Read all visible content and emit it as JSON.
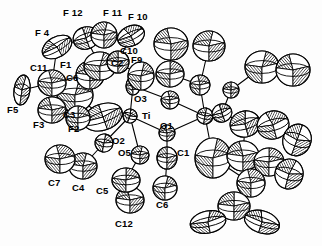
{
  "figure": {
    "kind": "ortep-thermal-ellipsoid-plot",
    "title": "",
    "caption": "",
    "background_color": "#fdfdfd",
    "line_color": "#000000",
    "fill_color": "#ffffff",
    "hatch_color": "#000000"
  },
  "chart_data": {
    "type": "scatter",
    "title": "",
    "xlabel": "",
    "ylabel": "",
    "grid": false,
    "legend": null,
    "labels": [
      {
        "text": "F 12",
        "x": 63,
        "y": 8
      },
      {
        "text": "F 11",
        "x": 103,
        "y": 8
      },
      {
        "text": "F 10",
        "x": 128,
        "y": 12
      },
      {
        "text": "F 4",
        "x": 35,
        "y": 28
      },
      {
        "text": "C10",
        "x": 120,
        "y": 46
      },
      {
        "text": "C11",
        "x": 30,
        "y": 63
      },
      {
        "text": "F1",
        "x": 60,
        "y": 60
      },
      {
        "text": "C2",
        "x": 111,
        "y": 58
      },
      {
        "text": "F9",
        "x": 131,
        "y": 55
      },
      {
        "text": "C6",
        "x": 66,
        "y": 73
      },
      {
        "text": "F5",
        "x": 7,
        "y": 105
      },
      {
        "text": "O3",
        "x": 134,
        "y": 94
      },
      {
        "text": "Ti",
        "x": 142,
        "y": 111
      },
      {
        "text": "C3",
        "x": 63,
        "y": 110
      },
      {
        "text": "F3",
        "x": 33,
        "y": 120
      },
      {
        "text": "F2",
        "x": 68,
        "y": 124
      },
      {
        "text": "O1",
        "x": 160,
        "y": 121
      },
      {
        "text": "O2",
        "x": 112,
        "y": 136
      },
      {
        "text": "O5",
        "x": 118,
        "y": 148
      },
      {
        "text": "C1",
        "x": 177,
        "y": 148
      },
      {
        "text": "C7",
        "x": 48,
        "y": 178
      },
      {
        "text": "C4",
        "x": 72,
        "y": 183
      },
      {
        "text": "C5",
        "x": 96,
        "y": 186
      },
      {
        "text": "C6",
        "x": 156,
        "y": 200
      },
      {
        "text": "C12",
        "x": 115,
        "y": 219
      }
    ],
    "atoms": [
      {
        "id": "Ti",
        "x": 130,
        "y": 116,
        "rx": 7,
        "ry": 7,
        "rot": 20,
        "style": "octant"
      },
      {
        "id": "Ti2",
        "x": 205,
        "y": 116,
        "rx": 8,
        "ry": 8,
        "rot": 10,
        "style": "octant"
      },
      {
        "id": "O3",
        "x": 133,
        "y": 86,
        "rx": 7,
        "ry": 9,
        "rot": 0,
        "style": "octant"
      },
      {
        "id": "O1",
        "x": 167,
        "y": 133,
        "rx": 8,
        "ry": 8,
        "rot": 0,
        "style": "octant"
      },
      {
        "id": "O2",
        "x": 104,
        "y": 143,
        "rx": 9,
        "ry": 9,
        "rot": 10,
        "style": "octant"
      },
      {
        "id": "O5",
        "x": 140,
        "y": 155,
        "rx": 9,
        "ry": 9,
        "rot": 0,
        "style": "octant"
      },
      {
        "id": "O4",
        "x": 170,
        "y": 100,
        "rx": 9,
        "ry": 9,
        "rot": 0,
        "style": "octant"
      },
      {
        "id": "C1",
        "x": 167,
        "y": 158,
        "rx": 10,
        "ry": 11,
        "rot": 0,
        "style": "octant"
      },
      {
        "id": "C6",
        "x": 165,
        "y": 188,
        "rx": 12,
        "ry": 12,
        "rot": 0,
        "style": "octant"
      },
      {
        "id": "C12",
        "x": 130,
        "y": 200,
        "rx": 14,
        "ry": 13,
        "rot": 0,
        "style": "octant"
      },
      {
        "id": "C5",
        "x": 126,
        "y": 180,
        "rx": 14,
        "ry": 12,
        "rot": 0,
        "style": "octant"
      },
      {
        "id": "C4",
        "x": 83,
        "y": 166,
        "rx": 14,
        "ry": 13,
        "rot": 0,
        "style": "octant"
      },
      {
        "id": "C7",
        "x": 60,
        "y": 159,
        "rx": 15,
        "ry": 14,
        "rot": 0,
        "style": "octant"
      },
      {
        "id": "C3",
        "x": 103,
        "y": 117,
        "rx": 20,
        "ry": 13,
        "rot": -20,
        "style": "octant"
      },
      {
        "id": "C6b",
        "x": 75,
        "y": 95,
        "rx": 18,
        "ry": 17,
        "rot": 0,
        "style": "octant"
      },
      {
        "id": "F3",
        "x": 52,
        "y": 110,
        "rx": 14,
        "ry": 13,
        "rot": 0,
        "style": "octant"
      },
      {
        "id": "F2",
        "x": 78,
        "y": 118,
        "rx": 12,
        "ry": 12,
        "rot": 0,
        "style": "octant"
      },
      {
        "id": "F5",
        "x": 22,
        "y": 90,
        "rx": 8,
        "ry": 15,
        "rot": 8,
        "style": "octant"
      },
      {
        "id": "C11",
        "x": 52,
        "y": 83,
        "rx": 14,
        "ry": 13,
        "rot": 0,
        "style": "octant"
      },
      {
        "id": "F1",
        "x": 90,
        "y": 75,
        "rx": 14,
        "ry": 14,
        "rot": 0,
        "style": "octant"
      },
      {
        "id": "C2",
        "x": 100,
        "y": 66,
        "rx": 16,
        "ry": 14,
        "rot": 0,
        "style": "octant"
      },
      {
        "id": "F4",
        "x": 57,
        "y": 47,
        "rx": 16,
        "ry": 10,
        "rot": -30,
        "style": "octant"
      },
      {
        "id": "F12",
        "x": 86,
        "y": 38,
        "rx": 13,
        "ry": 11,
        "rot": -20,
        "style": "octant"
      },
      {
        "id": "F11",
        "x": 104,
        "y": 35,
        "rx": 13,
        "ry": 13,
        "rot": 0,
        "style": "octant"
      },
      {
        "id": "F10",
        "x": 131,
        "y": 36,
        "rx": 14,
        "ry": 10,
        "rot": -25,
        "style": "octant"
      },
      {
        "id": "C10",
        "x": 118,
        "y": 62,
        "rx": 11,
        "ry": 11,
        "rot": 0,
        "style": "octant"
      },
      {
        "id": "F9",
        "x": 141,
        "y": 76,
        "rx": 13,
        "ry": 14,
        "rot": 0,
        "style": "octant"
      },
      {
        "id": "R1",
        "x": 171,
        "y": 44,
        "rx": 17,
        "ry": 16,
        "rot": 0,
        "style": "octant"
      },
      {
        "id": "R2",
        "x": 170,
        "y": 74,
        "rx": 14,
        "ry": 13,
        "rot": 0,
        "style": "octant"
      },
      {
        "id": "R3",
        "x": 209,
        "y": 46,
        "rx": 16,
        "ry": 15,
        "rot": 0,
        "style": "octant"
      },
      {
        "id": "R4",
        "x": 200,
        "y": 85,
        "rx": 10,
        "ry": 10,
        "rot": 0,
        "style": "octant"
      },
      {
        "id": "R5",
        "x": 231,
        "y": 90,
        "rx": 8,
        "ry": 8,
        "rot": 0,
        "style": "octant"
      },
      {
        "id": "R6",
        "x": 262,
        "y": 67,
        "rx": 17,
        "ry": 16,
        "rot": 0,
        "style": "octant"
      },
      {
        "id": "R7",
        "x": 293,
        "y": 70,
        "rx": 17,
        "ry": 16,
        "rot": 0,
        "style": "octant"
      },
      {
        "id": "R8",
        "x": 222,
        "y": 113,
        "rx": 10,
        "ry": 9,
        "rot": -20,
        "style": "octant"
      },
      {
        "id": "R9",
        "x": 245,
        "y": 124,
        "rx": 15,
        "ry": 13,
        "rot": -15,
        "style": "octant"
      },
      {
        "id": "R10",
        "x": 273,
        "y": 125,
        "rx": 16,
        "ry": 14,
        "rot": -15,
        "style": "octant"
      },
      {
        "id": "R11",
        "x": 297,
        "y": 140,
        "rx": 14,
        "ry": 16,
        "rot": 20,
        "style": "octant"
      },
      {
        "id": "R12",
        "x": 213,
        "y": 158,
        "rx": 18,
        "ry": 20,
        "rot": 0,
        "style": "octant"
      },
      {
        "id": "R13",
        "x": 243,
        "y": 156,
        "rx": 16,
        "ry": 15,
        "rot": 0,
        "style": "octant"
      },
      {
        "id": "R14",
        "x": 269,
        "y": 162,
        "rx": 15,
        "ry": 14,
        "rot": 0,
        "style": "octant"
      },
      {
        "id": "R15",
        "x": 289,
        "y": 174,
        "rx": 14,
        "ry": 15,
        "rot": 15,
        "style": "octant"
      },
      {
        "id": "R16",
        "x": 251,
        "y": 183,
        "rx": 14,
        "ry": 14,
        "rot": 0,
        "style": "octant"
      },
      {
        "id": "R17",
        "x": 234,
        "y": 206,
        "rx": 16,
        "ry": 14,
        "rot": 0,
        "style": "octant"
      },
      {
        "id": "R18",
        "x": 208,
        "y": 222,
        "rx": 18,
        "ry": 11,
        "rot": -12,
        "style": "octant"
      },
      {
        "id": "R19",
        "x": 262,
        "y": 222,
        "rx": 18,
        "ry": 11,
        "rot": 18,
        "style": "octant"
      }
    ],
    "bonds": [
      [
        "Ti",
        "O3"
      ],
      [
        "Ti",
        "O1"
      ],
      [
        "Ti",
        "O2"
      ],
      [
        "Ti",
        "O5"
      ],
      [
        "Ti",
        "C3"
      ],
      [
        "O3",
        "O4"
      ],
      [
        "O4",
        "Ti2"
      ],
      [
        "O1",
        "Ti2"
      ],
      [
        "Ti2",
        "R4"
      ],
      [
        "Ti2",
        "R8"
      ],
      [
        "Ti2",
        "R12"
      ],
      [
        "O1",
        "C1"
      ],
      [
        "C1",
        "C6"
      ],
      [
        "O5",
        "C5"
      ],
      [
        "C5",
        "C12"
      ],
      [
        "O2",
        "C4"
      ],
      [
        "C4",
        "C7"
      ],
      [
        "C3",
        "C6b"
      ],
      [
        "C6b",
        "C11"
      ],
      [
        "C11",
        "F5"
      ],
      [
        "C6b",
        "F1"
      ],
      [
        "F1",
        "C2"
      ],
      [
        "C2",
        "F12"
      ],
      [
        "C2",
        "C10"
      ],
      [
        "C10",
        "F10"
      ],
      [
        "C10",
        "F9"
      ],
      [
        "F12",
        "F11"
      ],
      [
        "F11",
        "F10"
      ],
      [
        "F4",
        "F12"
      ],
      [
        "C11",
        "F4"
      ],
      [
        "R1",
        "R2"
      ],
      [
        "R2",
        "R4"
      ],
      [
        "R3",
        "R4"
      ],
      [
        "R5",
        "R6"
      ],
      [
        "R6",
        "R7"
      ],
      [
        "R8",
        "R5"
      ],
      [
        "R9",
        "R10"
      ],
      [
        "R10",
        "R11"
      ],
      [
        "R8",
        "R9"
      ],
      [
        "R12",
        "R16"
      ],
      [
        "R13",
        "R14"
      ],
      [
        "R14",
        "R15"
      ],
      [
        "R16",
        "R17"
      ],
      [
        "R17",
        "R18"
      ],
      [
        "R17",
        "R19"
      ],
      [
        "R13",
        "R9"
      ],
      [
        "R16",
        "R13"
      ]
    ]
  }
}
